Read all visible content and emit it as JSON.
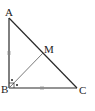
{
  "figure": {
    "type": "right-triangle",
    "stroke_color": "#2a2a2a",
    "median_color": "#6a6a6a",
    "labels": {
      "A": "A",
      "B": "B",
      "C": "C",
      "M": "M"
    },
    "vertices": {
      "A": [
        9,
        18
      ],
      "B": [
        9,
        88
      ],
      "C": [
        77,
        88
      ],
      "M": [
        43,
        53
      ]
    },
    "marks": {
      "right_angle_at": "B",
      "equal_sides": [
        "AB",
        "BC"
      ],
      "equal_side_tick": "double",
      "angle_bisector_dots": 2
    },
    "segments": [
      "AB",
      "BC",
      "CA",
      "BM"
    ]
  }
}
